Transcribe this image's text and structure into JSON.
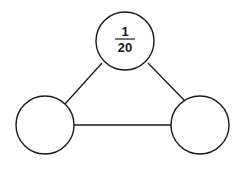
{
  "diagram": {
    "type": "triangle-graph",
    "nodes": [
      {
        "id": "top",
        "cx": 125,
        "cy": 41,
        "r": 29,
        "label": {
          "numerator": "1",
          "denominator": "20"
        }
      },
      {
        "id": "left",
        "cx": 45,
        "cy": 125,
        "r": 29,
        "label": null
      },
      {
        "id": "right",
        "cx": 200,
        "cy": 125,
        "r": 29,
        "label": null
      }
    ],
    "edges": [
      {
        "from": "top",
        "to": "left"
      },
      {
        "from": "top",
        "to": "right"
      },
      {
        "from": "left",
        "to": "right"
      }
    ],
    "top_label": {
      "numerator": "1",
      "denominator": "20"
    }
  }
}
